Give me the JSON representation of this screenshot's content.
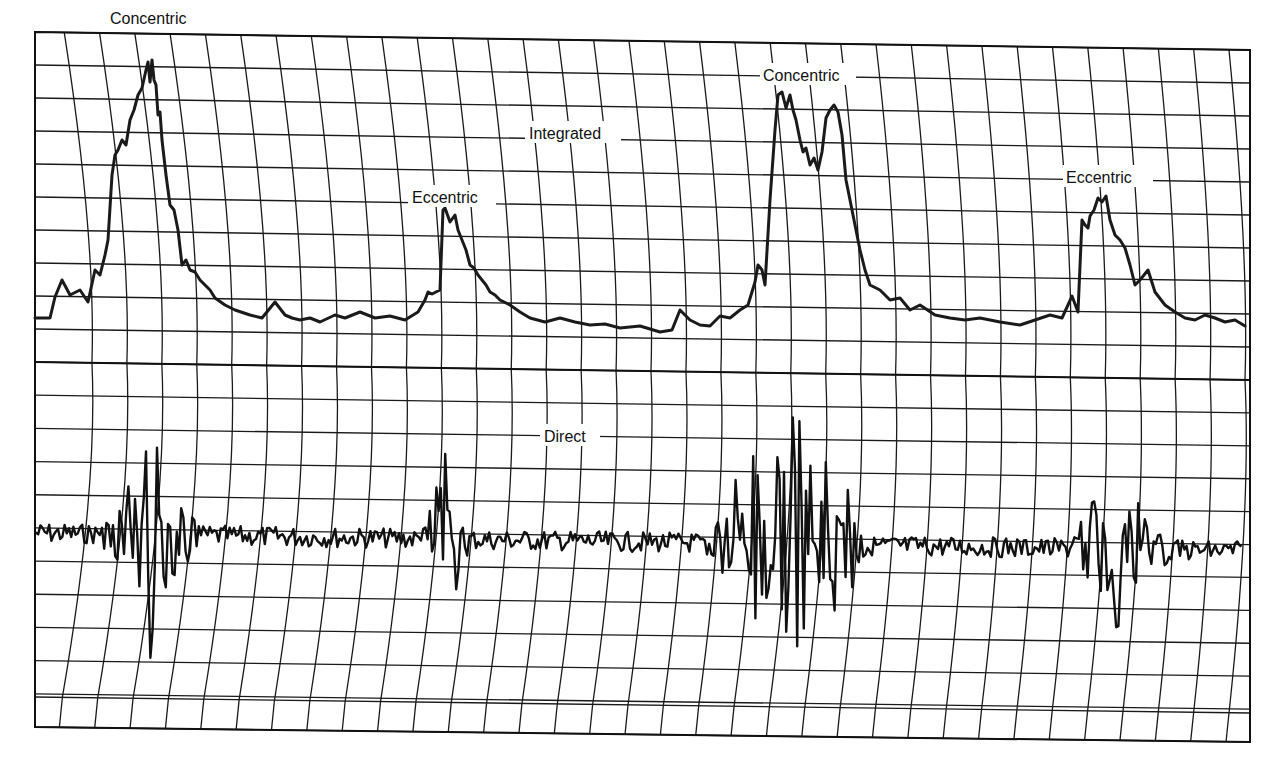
{
  "chart_data": {
    "type": "line",
    "title": "",
    "xlabel": "",
    "ylabel": "",
    "grid": true,
    "panels": [
      {
        "name": "Integrated",
        "label": "Integrated",
        "annotations": [
          {
            "text": "Concentric",
            "x": 155,
            "y": 20
          },
          {
            "text": "Eccentric",
            "x": 452,
            "y": 198
          },
          {
            "text": "Concentric",
            "x": 810,
            "y": 76
          },
          {
            "text": "Eccentric",
            "x": 1108,
            "y": 178
          }
        ],
        "series": [
          {
            "name": "Integrated EMG",
            "x": [
              35,
              50,
              55,
              62,
              70,
              80,
              88,
              95,
              100,
              105,
              108,
              112,
              115,
              118,
              122,
              126,
              130,
              134,
              138,
              142,
              146,
              148,
              150,
              152,
              154,
              156,
              158,
              160,
              162,
              166,
              170,
              174,
              178,
              182,
              186,
              190,
              195,
              200,
              205,
              210,
              215,
              225,
              235,
              250,
              262,
              275,
              285,
              292,
              300,
              310,
              320,
              335,
              345,
              360,
              375,
              390,
              405,
              418,
              425,
              428,
              432,
              440,
              443,
              445,
              450,
              455,
              458,
              462,
              466,
              470,
              474,
              478,
              482,
              486,
              490,
              495,
              500,
              510,
              520,
              530,
              545,
              560,
              575,
              590,
              605,
              620,
              640,
              660,
              672,
              680,
              690,
              700,
              710,
              720,
              730,
              740,
              748,
              755,
              758,
              762,
              765,
              770,
              775,
              778,
              782,
              786,
              790,
              793,
              796,
              800,
              803,
              806,
              810,
              814,
              818,
              822,
              826,
              830,
              834,
              838,
              842,
              846,
              850,
              855,
              860,
              865,
              870,
              880,
              890,
              900,
              910,
              920,
              935,
              950,
              965,
              980,
              1000,
              1020,
              1035,
              1050,
              1062,
              1068,
              1072,
              1078,
              1082,
              1085,
              1088,
              1090,
              1094,
              1098,
              1102,
              1106,
              1110,
              1115,
              1120,
              1125,
              1130,
              1135,
              1140,
              1148,
              1155,
              1165,
              1175,
              1185,
              1195,
              1205,
              1215,
              1225,
              1235,
              1245
            ],
            "y": [
              318,
              318,
              297,
              280,
              295,
              290,
              302,
              270,
              275,
              255,
              240,
              175,
              155,
              150,
              140,
              145,
              120,
              110,
              95,
              88,
              70,
              62,
              82,
              60,
              80,
              85,
              115,
              112,
              140,
              175,
              205,
              210,
              230,
              265,
              260,
              270,
              272,
              280,
              285,
              290,
              298,
              305,
              310,
              315,
              318,
              302,
              315,
              318,
              320,
              318,
              322,
              315,
              318,
              312,
              318,
              316,
              320,
              312,
              300,
              292,
              294,
              290,
              210,
              208,
              222,
              215,
              230,
              240,
              250,
              265,
              268,
              275,
              280,
              285,
              292,
              295,
              300,
              305,
              312,
              318,
              322,
              318,
              322,
              325,
              324,
              328,
              326,
              332,
              330,
              310,
              320,
              325,
              326,
              316,
              318,
              310,
              305,
              282,
              265,
              270,
              285,
              200,
              130,
              95,
              92,
              108,
              95,
              110,
              120,
              140,
              152,
              148,
              165,
              158,
              170,
              152,
              118,
              110,
              105,
              112,
              135,
              180,
              200,
              225,
              250,
              270,
              285,
              290,
              300,
              298,
              310,
              305,
              315,
              318,
              320,
              318,
              322,
              325,
              320,
              315,
              318,
              305,
              296,
              312,
              220,
              225,
              228,
              216,
              210,
              198,
              202,
              196,
              220,
              235,
              240,
              248,
              265,
              285,
              280,
              270,
              292,
              305,
              312,
              318,
              320,
              315,
              318,
              322,
              320,
              326
            ]
          }
        ]
      },
      {
        "name": "Direct",
        "label": "Direct",
        "annotations": [],
        "series": [
          {
            "name": "Direct EMG",
            "baseline_y": 533,
            "bursts": [
              {
                "x_start": 100,
                "x_end": 200,
                "amplitude": 90
              },
              {
                "x_start": 420,
                "x_end": 470,
                "amplitude": 60
              },
              {
                "x_start": 700,
                "x_end": 870,
                "amplitude": 120
              },
              {
                "x_start": 1070,
                "x_end": 1170,
                "amplitude": 70
              }
            ]
          }
        ]
      }
    ],
    "layout": {
      "frame": {
        "x0": 35,
        "y0": 30,
        "x1": 1250,
        "y1": 740
      },
      "midline_y_left": 362,
      "midline_y_right": 380,
      "h_spacing": 33,
      "v_spacing": 36
    }
  },
  "labels": {
    "integrated": "Integrated",
    "direct": "Direct",
    "concentric_1": "Concentric",
    "eccentric_1": "Eccentric",
    "concentric_2": "Concentric",
    "eccentric_2": "Eccentric"
  }
}
